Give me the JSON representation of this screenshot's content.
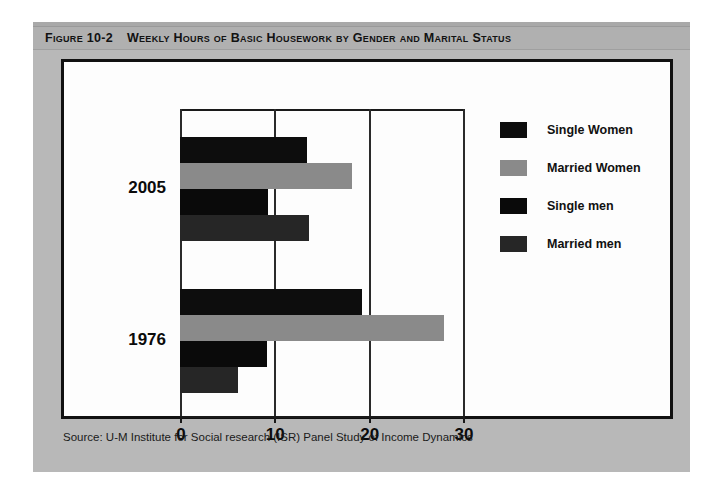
{
  "figure": {
    "number": "Figure 10-2",
    "title": "Weekly Hours of Basic Housework by Gender and Marital Status",
    "source": "Source: U-M Institute for Social research (ISR) Panel Study of Income Dynamics"
  },
  "colors": {
    "panel": "#b8b8b8",
    "title_band": "#b0b0b0",
    "chart_background": "#fdfdfd",
    "chart_border": "#111111",
    "single_women": "#0d0d0d",
    "married_women": "#8a8a8a",
    "single_men": "#0a0a0a",
    "married_men": "#262626"
  },
  "chart_data": {
    "type": "bar",
    "orientation": "horizontal",
    "title": "Weekly Hours of Basic Housework by Gender and Marital Status",
    "xlabel": "",
    "ylabel": "",
    "xlim": [
      0,
      30
    ],
    "xticks": [
      0,
      10,
      20,
      30
    ],
    "xtick_labels": [
      "0",
      "10",
      "20",
      "30"
    ],
    "grid": true,
    "grid_axis": "x",
    "legend_position": "right",
    "categories": [
      "2005",
      "1976"
    ],
    "series": [
      {
        "name": "Single Women",
        "color": "#0d0d0d",
        "values": [
          13.5,
          19.3
        ]
      },
      {
        "name": "Married Women",
        "color": "#8a8a8a",
        "values": [
          18.2,
          28.0
        ]
      },
      {
        "name": "Single men",
        "color": "#0a0a0a",
        "values": [
          9.3,
          9.2
        ]
      },
      {
        "name": "Married men",
        "color": "#262626",
        "values": [
          13.7,
          6.2
        ]
      }
    ]
  }
}
